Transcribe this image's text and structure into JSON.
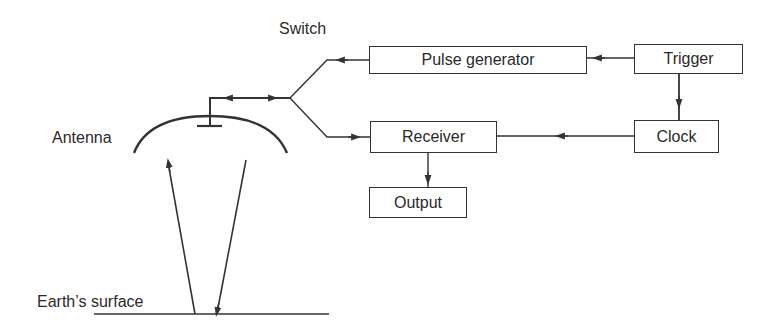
{
  "diagram": {
    "labels": {
      "switch": "Switch",
      "antenna": "Antenna",
      "earth_surface": "Earth’s surface"
    },
    "blocks": {
      "pulse_generator": "Pulse generator",
      "trigger": "Trigger",
      "clock": "Clock",
      "receiver": "Receiver",
      "output": "Output"
    },
    "connections": [
      {
        "from": "Trigger",
        "to": "Pulse generator"
      },
      {
        "from": "Trigger",
        "to": "Clock"
      },
      {
        "from": "Clock",
        "to": "Receiver"
      },
      {
        "from": "Receiver",
        "to": "Output"
      },
      {
        "from": "Pulse generator",
        "to": "Switch"
      },
      {
        "from": "Switch",
        "to": "Receiver"
      },
      {
        "from": "Switch",
        "to": "Antenna",
        "bidirectional": true
      },
      {
        "from": "Earth's surface",
        "to": "Antenna",
        "type": "reflected signal"
      },
      {
        "from": "Antenna",
        "to": "Earth's surface",
        "type": "transmitted signal"
      }
    ],
    "colors": {
      "line": "#333333",
      "text": "#2a2a2a",
      "background": "#ffffff"
    }
  }
}
